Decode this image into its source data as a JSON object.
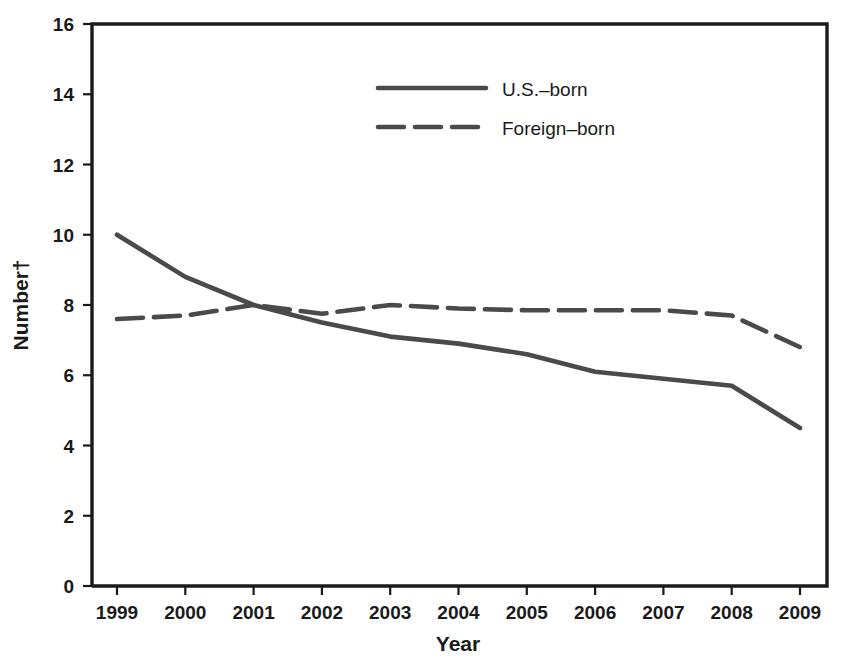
{
  "chart_data": {
    "type": "line",
    "title": "",
    "subtitle": "",
    "xlabel": "Year",
    "ylabel": "Number†",
    "x": [
      1999,
      2000,
      2001,
      2002,
      2003,
      2004,
      2005,
      2006,
      2007,
      2008,
      2009
    ],
    "categories": [
      "1999",
      "2000",
      "2001",
      "2002",
      "2003",
      "2004",
      "2005",
      "2006",
      "2007",
      "2008",
      "2009"
    ],
    "series": [
      {
        "name": "U.S.–born",
        "style": "solid",
        "color": "#4a4a4a",
        "values": [
          10.0,
          8.8,
          8.0,
          7.5,
          7.1,
          6.9,
          6.6,
          6.1,
          5.9,
          5.7,
          4.5
        ]
      },
      {
        "name": "Foreign–born",
        "style": "dashed",
        "color": "#4a4a4a",
        "values": [
          7.6,
          7.7,
          8.0,
          7.75,
          8.0,
          7.9,
          7.85,
          7.85,
          7.85,
          7.7,
          6.8
        ]
      }
    ],
    "xlim": [
      1999,
      2009
    ],
    "ylim": [
      0,
      16
    ],
    "yticks": [
      0,
      2,
      4,
      6,
      8,
      10,
      12,
      14,
      16
    ],
    "ytick_labels": [
      "0",
      "2",
      "4",
      "6",
      "8",
      "10",
      "12",
      "14",
      "16"
    ],
    "xticks": [
      1999,
      2000,
      2001,
      2002,
      2003,
      2004,
      2005,
      2006,
      2007,
      2008,
      2009
    ],
    "grid": false,
    "legend_position": "top-center",
    "legend": [
      {
        "label": "U.S.–born",
        "style": "solid"
      },
      {
        "label": "Foreign–born",
        "style": "dashed"
      }
    ]
  },
  "axes": {
    "y_title": "Number†",
    "x_title": "Year",
    "y_ticks": [
      "16",
      "14",
      "12",
      "10",
      "8",
      "6",
      "4",
      "2",
      "0"
    ],
    "x_ticks": [
      "1999",
      "2000",
      "2001",
      "2002",
      "2003",
      "2004",
      "2005",
      "2006",
      "2007",
      "2008",
      "2009"
    ]
  },
  "legend": {
    "entry_1_label": "U.S.–born",
    "entry_2_label": "Foreign–born"
  },
  "colors": {
    "line": "#4a4a4a",
    "axis": "#1a1a1a",
    "background": "#ffffff"
  }
}
